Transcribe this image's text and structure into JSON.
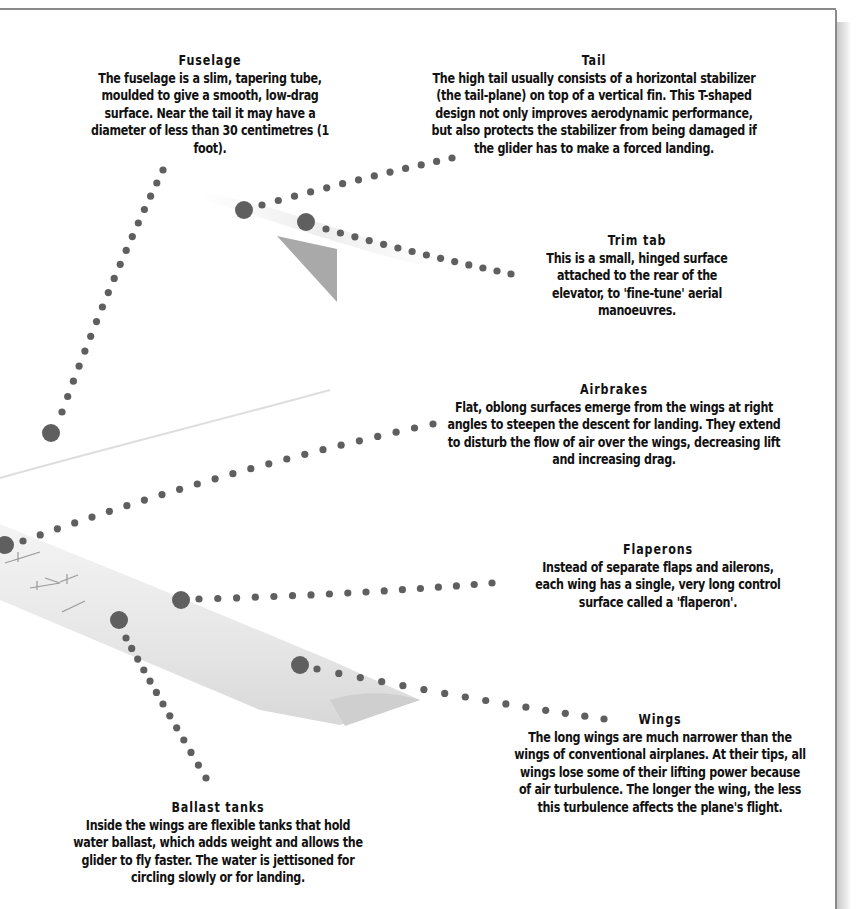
{
  "callouts": {
    "fuselage": {
      "title": "Fuselage",
      "text": "The fuselage is a slim, tapering tube, moulded to give a smooth, low-drag surface. Near the tail it may have a diameter of less than 30 centimetres (1 foot)."
    },
    "tail": {
      "title": "Tail",
      "text": "The high tail usually consists of a horizontal stabilizer (the tail-plane) on top of a vertical fin. This T-shaped design not only improves aerodynamic performance, but also protects the stabilizer from being damaged if the glider has to make a forced landing."
    },
    "trim_tab": {
      "title": "Trim tab",
      "text": "This is a small, hinged surface attached to the rear of the elevator, to 'fine-tune' aerial manoeuvres."
    },
    "airbrakes": {
      "title": "Airbrakes",
      "text": "Flat, oblong surfaces emerge from the wings at right angles to steepen the descent for landing. They extend to disturb the flow of air over the wings, decreasing lift and increasing drag."
    },
    "flaperons": {
      "title": "Flaperons",
      "text": "Instead of separate flaps and ailerons, each wing has a single, very long control surface called a 'flaperon'."
    },
    "wings": {
      "title": "Wings",
      "text": "The long wings are much narrower than the wings of conventional airplanes. At their tips, all wings lose some of their lifting power because of air turbulence. The longer the wing, the less this turbulence affects the plane's flight."
    },
    "ballast_tanks": {
      "title": "Ballast tanks",
      "text": "Inside the wings are flexible tanks that hold water ballast, which adds weight and allows the glider to fly faster. The water is jettisoned for circling slowly or for landing."
    }
  },
  "colors": {
    "dot": "#5f5f5f",
    "frame": "#8a8a8a",
    "text": "#111111"
  }
}
